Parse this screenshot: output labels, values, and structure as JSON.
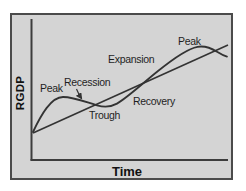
{
  "diagram": {
    "y_axis_label": "RGDP",
    "x_axis_label": "Time",
    "phase_labels": {
      "peak_first": "Peak",
      "recession": "Recession",
      "trough": "Trough",
      "recovery": "Recovery",
      "expansion": "Expansion",
      "peak_second": "Peak"
    },
    "colors": {
      "page_background": "#ffffff",
      "panel_background": "#d4d4d4",
      "panel_border": "#4b4b4b",
      "line": "#333333",
      "text": "#1f1f1f"
    }
  }
}
